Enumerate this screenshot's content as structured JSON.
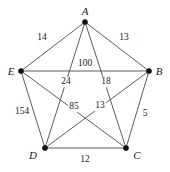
{
  "figure": {
    "name": "weighted-complete-graph-k5",
    "background_color": "#ffffff",
    "edge_color": "#4a4a4a",
    "vertex_color": "#111111",
    "text_color": "#1a1a1a"
  },
  "chart_data": {
    "type": "diagram",
    "title": "",
    "graph_type": "complete-graph-K5",
    "nodes": [
      {
        "id": "A",
        "label": "A",
        "x": 85,
        "y": 22,
        "label_x": 85,
        "label_y": 11
      },
      {
        "id": "B",
        "label": "B",
        "x": 149,
        "y": 71,
        "label_x": 159,
        "label_y": 71
      },
      {
        "id": "C",
        "label": "C",
        "x": 126,
        "y": 148,
        "label_x": 137,
        "label_y": 155
      },
      {
        "id": "D",
        "label": "D",
        "x": 45,
        "y": 148,
        "label_x": 33,
        "label_y": 155
      },
      {
        "id": "E",
        "label": "E",
        "x": 21,
        "y": 71,
        "label_x": 11,
        "label_y": 71
      }
    ],
    "edges": [
      {
        "from": "E",
        "to": "A",
        "weight": "14",
        "label_x": 42,
        "label_y": 38
      },
      {
        "from": "A",
        "to": "B",
        "weight": "13",
        "label_x": 124,
        "label_y": 38
      },
      {
        "from": "E",
        "to": "B",
        "weight": "100",
        "label_x": 85,
        "label_y": 64
      },
      {
        "from": "A",
        "to": "D",
        "weight": "24",
        "label_x": 66,
        "label_y": 82
      },
      {
        "from": "A",
        "to": "C",
        "weight": "18",
        "label_x": 106,
        "label_y": 82
      },
      {
        "from": "E",
        "to": "C",
        "weight": "85",
        "label_x": 74,
        "label_y": 107
      },
      {
        "from": "B",
        "to": "D",
        "weight": "13",
        "label_x": 100,
        "label_y": 106
      },
      {
        "from": "E",
        "to": "D",
        "weight": "154",
        "label_x": 22,
        "label_y": 112
      },
      {
        "from": "B",
        "to": "C",
        "weight": "5",
        "label_x": 145,
        "label_y": 114
      },
      {
        "from": "D",
        "to": "C",
        "weight": "12",
        "label_x": 85,
        "label_y": 160
      }
    ]
  }
}
